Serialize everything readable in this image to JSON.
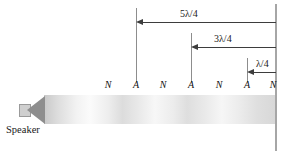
{
  "figure": {
    "speaker": {
      "label": "Speaker"
    },
    "dimensions": [
      {
        "label": "5λ/4",
        "tick_x": 136,
        "label_x": 180,
        "row_y": 22
      },
      {
        "label": "3λ/4",
        "tick_x": 191,
        "label_x": 214,
        "row_y": 47
      },
      {
        "label": "λ/4",
        "tick_x": 247,
        "label_x": 256,
        "row_y": 72
      }
    ],
    "markers": [
      {
        "label": "N",
        "x": 108,
        "kind": "node"
      },
      {
        "label": "A",
        "x": 136,
        "kind": "antinode"
      },
      {
        "label": "N",
        "x": 163,
        "kind": "node"
      },
      {
        "label": "A",
        "x": 191,
        "kind": "antinode"
      },
      {
        "label": "N",
        "x": 219,
        "kind": "node"
      },
      {
        "label": "A",
        "x": 247,
        "kind": "antinode"
      },
      {
        "label": "N",
        "x": 273,
        "kind": "node"
      }
    ],
    "colors": {
      "wall": "#a6a6a6",
      "arrow": "#3d3d3d",
      "tick": "#8d8d8d",
      "speaker_cone": "#8e8e8e",
      "text": "#1a1a1a",
      "background": "#ffffff"
    }
  }
}
